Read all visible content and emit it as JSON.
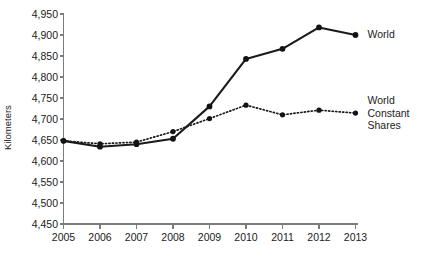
{
  "chart_data": {
    "type": "line",
    "title": "",
    "xlabel": "",
    "ylabel": "Kilometers",
    "categories": [
      "2005",
      "2006",
      "2007",
      "2008",
      "2009",
      "2010",
      "2011",
      "2012",
      "2013"
    ],
    "x": [
      2005,
      2006,
      2007,
      2008,
      2009,
      2010,
      2011,
      2012,
      2013
    ],
    "ylim": [
      4450,
      4950
    ],
    "xlim": [
      2005,
      2013
    ],
    "y_ticks": [
      4450,
      4500,
      4550,
      4600,
      4650,
      4700,
      4750,
      4800,
      4850,
      4900,
      4950
    ],
    "y_tick_labels": [
      "4,450",
      "4,500",
      "4,550",
      "4,600",
      "4,650",
      "4,700",
      "4,750",
      "4,800",
      "4,850",
      "4,900",
      "4,950"
    ],
    "grid": false,
    "legend_position": "right-inline-labels",
    "series": [
      {
        "name": "World",
        "style": "solid",
        "marker": "filled-circle",
        "color": "#1a1a1a",
        "values": [
          4648,
          4634,
          4640,
          4653,
          4730,
          4843,
          4867,
          4918,
          4900
        ]
      },
      {
        "name": "World Constant Shares",
        "style": "dotted",
        "marker": "filled-circle",
        "color": "#1a1a1a",
        "values": [
          4648,
          4641,
          4645,
          4670,
          4701,
          4733,
          4710,
          4721,
          4714
        ]
      }
    ]
  },
  "labels": {
    "y_axis_title": "Kilometers",
    "series_world": "World",
    "series_world_constant_shares": "World\nConstant\nShares"
  }
}
